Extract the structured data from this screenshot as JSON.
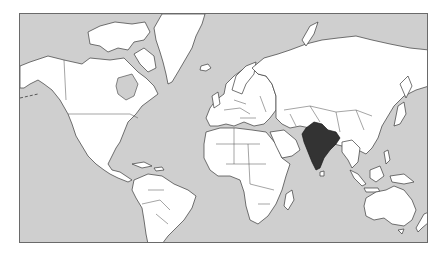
{
  "map": {
    "projection": "Mercator",
    "highlighted_country": "India",
    "colors": {
      "ocean": "#cfcfcf",
      "land": "#ffffff",
      "highlight": "#333333",
      "border": "#3a3a3a"
    },
    "regions": [
      "North America",
      "Greenland",
      "South America",
      "Europe",
      "Africa",
      "Asia",
      "India",
      "Southeast Asia",
      "Australia",
      "New Zealand"
    ]
  }
}
